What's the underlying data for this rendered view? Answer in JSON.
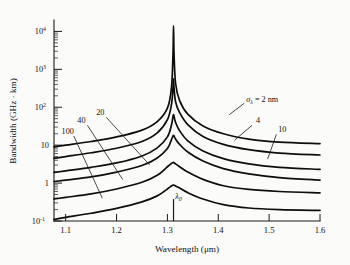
{
  "figure": {
    "background_color": "#fbfbf9",
    "line_color": "#0d0d0d"
  },
  "axes": {
    "x_title_main": "Wavelength (",
    "x_title_unit": "μm",
    "x_title_close": ")",
    "y_title": "Bandwidth (GHz · km)",
    "x_ticks": [
      "1.1",
      "1.2",
      "1.3",
      "1.4",
      "1.5",
      "1.6"
    ],
    "x_tick_values": [
      1.1,
      1.2,
      1.3,
      1.4,
      1.5,
      1.6
    ],
    "y_ticks": [
      "10",
      "10",
      "10",
      "10",
      "1",
      "10"
    ],
    "y_tick_exponents": [
      "4",
      "3",
      "2",
      "",
      "",
      "-1"
    ],
    "y_tick_values": [
      10000,
      1000,
      100,
      10,
      1,
      0.1
    ]
  },
  "annotations": {
    "lambda_zero": "λ",
    "lambda_zero_sub": "0",
    "sigma_symbol": "σ",
    "sigma_sub": "λ",
    "sigma_equals": " = 2 nm",
    "curve_labels": [
      "100",
      "40",
      "20",
      "4",
      "10"
    ]
  },
  "chart_data": {
    "type": "line",
    "title": "",
    "xlabel": "Wavelength (μm)",
    "ylabel": "Bandwidth (GHz · km)",
    "xlim": [
      1.077,
      1.6
    ],
    "ylim": [
      0.1,
      20000
    ],
    "yscale": "log",
    "xscale": "linear",
    "grid": false,
    "legend": "inline-annotations",
    "lambda_zero_um": 1.312,
    "series": [
      {
        "name": "σλ = 2 nm",
        "sigma_nm": 2,
        "label": "σλ = 2 nm",
        "label_x": 1.455,
        "label_y": 140,
        "x": [
          1.077,
          1.1,
          1.15,
          1.2,
          1.25,
          1.28,
          1.3,
          1.308,
          1.311,
          1.312,
          1.313,
          1.316,
          1.324,
          1.34,
          1.37,
          1.41,
          1.46,
          1.52,
          1.6
        ],
        "y": [
          9.0,
          10.0,
          12.5,
          16.5,
          25.0,
          42.0,
          95.0,
          330.0,
          2600.0,
          14000.0,
          2600.0,
          430.0,
          150.0,
          66.0,
          32.0,
          20.0,
          14.5,
          12.0,
          11.0
        ]
      },
      {
        "name": "4 nm",
        "sigma_nm": 4,
        "label": "4",
        "label_x": 1.478,
        "label_y": 38,
        "x": [
          1.077,
          1.1,
          1.15,
          1.2,
          1.25,
          1.28,
          1.3,
          1.308,
          1.311,
          1.312,
          1.313,
          1.316,
          1.324,
          1.34,
          1.37,
          1.41,
          1.46,
          1.52,
          1.6
        ],
        "y": [
          4.5,
          5.0,
          6.3,
          8.3,
          12.5,
          21.0,
          47.0,
          120.0,
          330.0,
          560.0,
          330.0,
          140.0,
          72.0,
          35.0,
          17.0,
          10.5,
          7.6,
          6.2,
          5.5
        ]
      },
      {
        "name": "10 nm",
        "sigma_nm": 10,
        "label": "10",
        "label_x": 1.526,
        "label_y": 22,
        "x": [
          1.077,
          1.1,
          1.15,
          1.2,
          1.25,
          1.28,
          1.3,
          1.308,
          1.311,
          1.312,
          1.313,
          1.316,
          1.324,
          1.34,
          1.37,
          1.41,
          1.46,
          1.52,
          1.6
        ],
        "y": [
          1.9,
          2.1,
          2.6,
          3.4,
          5.2,
          8.5,
          16.5,
          34.0,
          58.0,
          64.0,
          58.0,
          40.0,
          24.0,
          13.0,
          7.0,
          4.4,
          3.2,
          2.6,
          2.3
        ]
      },
      {
        "name": "20 nm",
        "sigma_nm": 20,
        "label": "20",
        "label_x": 1.168,
        "label_y": 62,
        "x": [
          1.077,
          1.1,
          1.15,
          1.2,
          1.25,
          1.28,
          1.3,
          1.308,
          1.311,
          1.312,
          1.313,
          1.316,
          1.324,
          1.34,
          1.37,
          1.41,
          1.46,
          1.52,
          1.6
        ],
        "y": [
          1.1,
          1.2,
          1.45,
          1.95,
          2.9,
          4.6,
          8.2,
          14.0,
          17.5,
          18.0,
          17.5,
          14.5,
          10.5,
          6.6,
          3.8,
          2.4,
          1.75,
          1.4,
          1.2
        ]
      },
      {
        "name": "40 nm",
        "sigma_nm": 40,
        "label": "40",
        "label_x": 1.131,
        "label_y": 38,
        "x": [
          1.077,
          1.1,
          1.15,
          1.2,
          1.25,
          1.28,
          1.3,
          1.308,
          1.311,
          1.312,
          1.313,
          1.316,
          1.324,
          1.34,
          1.37,
          1.41,
          1.46,
          1.52,
          1.6
        ],
        "y": [
          0.38,
          0.42,
          0.52,
          0.7,
          1.05,
          1.6,
          2.7,
          3.3,
          3.45,
          3.5,
          3.45,
          3.2,
          2.7,
          1.95,
          1.25,
          0.85,
          0.68,
          0.6,
          0.55
        ]
      },
      {
        "name": "100 nm",
        "sigma_nm": 100,
        "label": "100",
        "label_x": 1.104,
        "label_y": 20,
        "x": [
          1.077,
          1.1,
          1.15,
          1.2,
          1.25,
          1.28,
          1.3,
          1.308,
          1.311,
          1.312,
          1.313,
          1.316,
          1.324,
          1.34,
          1.37,
          1.41,
          1.46,
          1.52,
          1.6
        ],
        "y": [
          0.11,
          0.125,
          0.16,
          0.215,
          0.32,
          0.46,
          0.7,
          0.84,
          0.88,
          0.89,
          0.88,
          0.84,
          0.74,
          0.56,
          0.38,
          0.27,
          0.22,
          0.2,
          0.19
        ]
      }
    ]
  }
}
